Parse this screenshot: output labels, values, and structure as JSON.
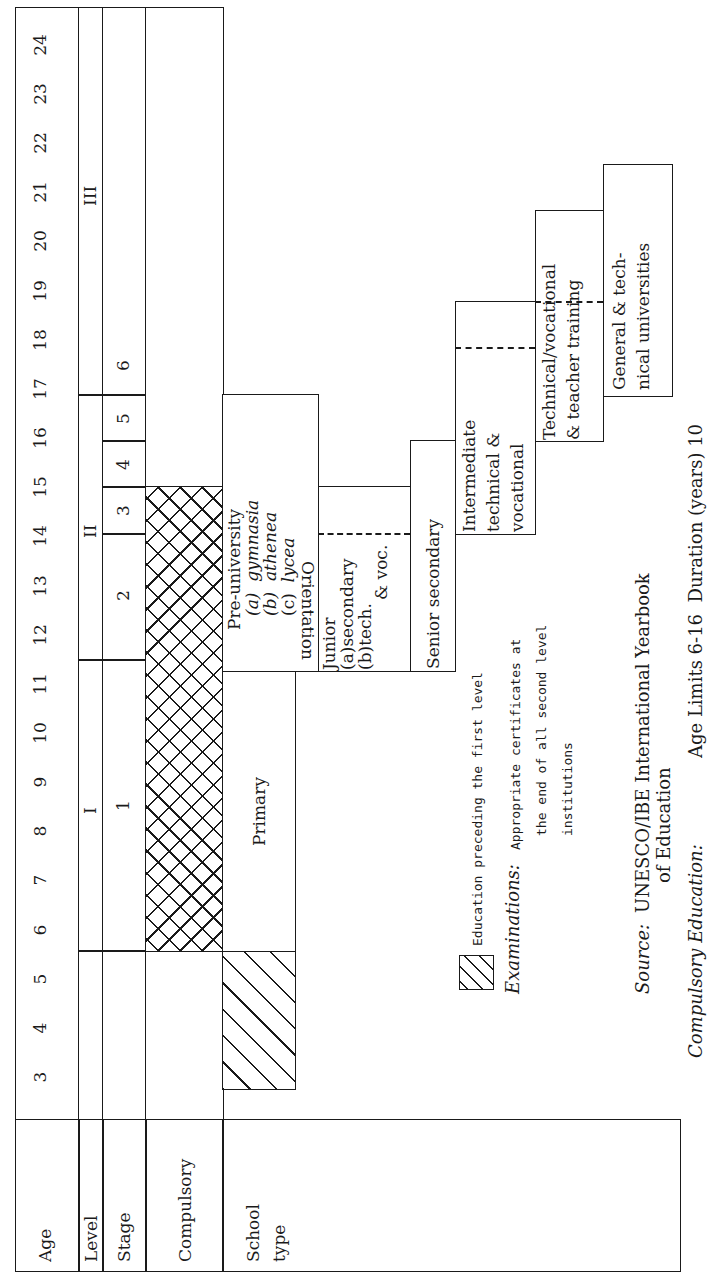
{
  "row_labels": {
    "age": "Age",
    "level": "Level",
    "stage": "Stage",
    "compulsory": "Compulsory",
    "school_type_1": "School",
    "school_type_2": "type"
  },
  "ages": [
    "3",
    "4",
    "5",
    "6",
    "7",
    "8",
    "9",
    "10",
    "11",
    "12",
    "13",
    "14",
    "15",
    "16",
    "17",
    "18",
    "19",
    "20",
    "21",
    "22",
    "23",
    "24"
  ],
  "levels": {
    "l1": "I",
    "l2": "II",
    "l3": "III"
  },
  "stages": {
    "s1": "1",
    "s2": "2",
    "s3": "3",
    "s4": "4",
    "s5": "5",
    "s6": "6"
  },
  "school_types": {
    "primary": "Primary",
    "pre_university": {
      "title": "Pre-university",
      "a_label": "(a)",
      "a": "gymnasia",
      "b_label": "(b)",
      "b": "athenea",
      "c_label": "(c)",
      "c": "lycea"
    },
    "orientation": "Orientation",
    "junior": {
      "title": "Junior",
      "a": "(a)secondary",
      "b": "(b)tech.",
      "b2": "& voc."
    },
    "senior_secondary": "Senior secondary",
    "intermediate": {
      "l1": "Intermediate",
      "l2": "technical &",
      "l3": "vocational"
    },
    "technical_vocational": {
      "l1": "Technical/vocational",
      "l2": "& teacher training"
    },
    "universities": {
      "l1": "General & tech-",
      "l2": "nical universities"
    }
  },
  "legend": {
    "pre_primary": "Education preceding the first level"
  },
  "notes": {
    "examinations_label": "Examinations:",
    "examinations_l1": "Appropriate certificates at",
    "examinations_l2": "the end of all second level",
    "examinations_l3": "institutions",
    "source_label": "Source:",
    "source_l1": "UNESCO/IBE International Yearbook",
    "source_l2": "of Education",
    "compulsory_label_1": "Compulsory",
    "compulsory_label_2": "Education:",
    "compulsory_value": "Age Limits 6-16  Duration (years) 10"
  }
}
